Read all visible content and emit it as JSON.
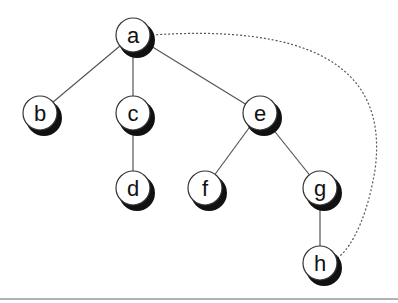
{
  "diagram": {
    "type": "tree",
    "nodes": [
      {
        "id": "a",
        "label": "a",
        "x": 133,
        "y": 35
      },
      {
        "id": "b",
        "label": "b",
        "x": 40,
        "y": 113
      },
      {
        "id": "c",
        "label": "c",
        "x": 133,
        "y": 113
      },
      {
        "id": "e",
        "label": "e",
        "x": 260,
        "y": 113
      },
      {
        "id": "d",
        "label": "d",
        "x": 133,
        "y": 188
      },
      {
        "id": "f",
        "label": "f",
        "x": 205,
        "y": 188
      },
      {
        "id": "g",
        "label": "g",
        "x": 320,
        "y": 188
      },
      {
        "id": "h",
        "label": "h",
        "x": 320,
        "y": 263
      }
    ],
    "edges": [
      {
        "from": "a",
        "to": "b",
        "style": "solid"
      },
      {
        "from": "a",
        "to": "c",
        "style": "solid"
      },
      {
        "from": "a",
        "to": "e",
        "style": "solid"
      },
      {
        "from": "c",
        "to": "d",
        "style": "solid"
      },
      {
        "from": "e",
        "to": "f",
        "style": "solid"
      },
      {
        "from": "e",
        "to": "g",
        "style": "solid"
      },
      {
        "from": "g",
        "to": "h",
        "style": "solid"
      },
      {
        "from": "a",
        "to": "h",
        "style": "dotted"
      }
    ]
  }
}
